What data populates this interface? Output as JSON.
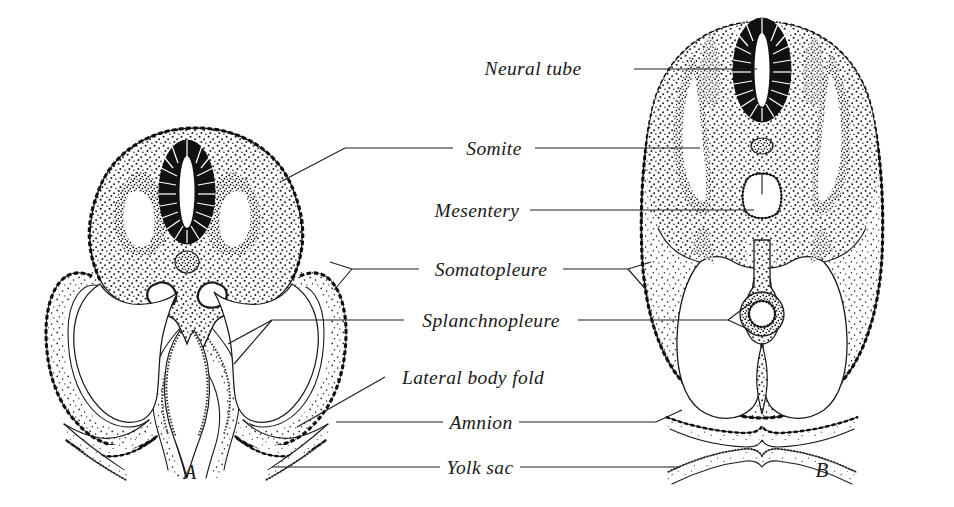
{
  "figure": {
    "background_color": "#ffffff",
    "ink_color": "#1a1a1a"
  },
  "panels": [
    {
      "id": "A",
      "letter": "A",
      "description": "Earlier stage embryo: flat-sided body with wide open lateral body folds, paired dorsal aortae, open gut groove continuous with yolk sac",
      "letter_x": 190,
      "letter_y": 479
    },
    {
      "id": "B",
      "letter": "B",
      "description": "Later stage embryo: body folds fused ventrally, gut closed into a tube suspended by mesentery, amnion complete over embryo",
      "letter_x": 822,
      "letter_y": 477
    }
  ],
  "labels": [
    {
      "id": "neural-tube",
      "text": "Neural tube",
      "text_x": 533,
      "text_y": 75,
      "points_to": [
        "B"
      ]
    },
    {
      "id": "somite",
      "text": "Somite",
      "text_x": 463,
      "text_y": 153,
      "points_to": [
        "A",
        "B"
      ]
    },
    {
      "id": "mesentery",
      "text": "Mesentery",
      "text_x": 425,
      "text_y": 215,
      "points_to": [
        "B"
      ]
    },
    {
      "id": "somatopleure",
      "text": "Somatopleure",
      "text_x": 429,
      "text_y": 274,
      "points_to": [
        "A",
        "B"
      ]
    },
    {
      "id": "splanchnopleure",
      "text": "Splanchnopleure",
      "text_x": 414,
      "text_y": 325,
      "points_to": [
        "A",
        "B"
      ]
    },
    {
      "id": "lateral-body-fold",
      "text": "Lateral body fold",
      "text_x": 393,
      "text_y": 382,
      "points_to": [
        "A"
      ]
    },
    {
      "id": "amnion",
      "text": "Amnion",
      "text_x": 452,
      "text_y": 427,
      "points_to": [
        "A",
        "B"
      ]
    },
    {
      "id": "yolk-sac",
      "text": "Yolk sac",
      "text_x": 449,
      "text_y": 472,
      "points_to": [
        "A",
        "B"
      ]
    }
  ],
  "structures": {
    "panel_a": [
      "neural-tube",
      "notochord",
      "left-somite",
      "right-somite",
      "left-dorsal-aorta",
      "right-dorsal-aorta",
      "gut-groove",
      "left-lateral-body-fold",
      "right-lateral-body-fold",
      "amniotic-fold-left",
      "amniotic-fold-right",
      "yolk-sac-wall",
      "coelom-left",
      "coelom-right",
      "ectoderm-layer"
    ],
    "panel_b": [
      "neural-tube",
      "notochord",
      "left-somite",
      "right-somite",
      "gut-tube",
      "dorsal-mesentery",
      "coelom",
      "amnion-membrane",
      "yolk-sac-membrane",
      "ectoderm-layer",
      "ventral-fusion-point"
    ]
  }
}
